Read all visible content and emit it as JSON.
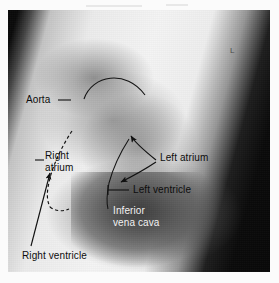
{
  "figure": {
    "modality": "radiograph",
    "view": "lateral",
    "film_marker": "L",
    "plate": {
      "x": 8,
      "y": 10,
      "width": 262,
      "height": 262,
      "background_color": "#0a0a0a"
    },
    "colors": {
      "page_background": "#ffffff",
      "film_dark": "#0a0a0a",
      "soft_tissue_bright": "#f4f4f4",
      "annotation_dark": "#0d0d0d",
      "annotation_light": "#f2f2f2"
    }
  },
  "annotations": [
    {
      "id": "aorta",
      "text": "Aorta",
      "text_color": "dark",
      "x": 26,
      "y": 100,
      "leader": "dash-right",
      "structure": "aortic arch"
    },
    {
      "id": "right-atrium",
      "text": "Right\natrium",
      "text_color": "dark",
      "x": 45,
      "y": 155,
      "leader": "dash-left",
      "structure": "right atrium"
    },
    {
      "id": "left-atrium",
      "text": "Left atrium",
      "text_color": "dark",
      "x": 160,
      "y": 157,
      "leader": "two-arrows",
      "structure": "left atrium"
    },
    {
      "id": "left-ventricle",
      "text": "Left ventricle",
      "text_color": "dark",
      "x": 133,
      "y": 184,
      "leader": "tick-left",
      "structure": "left ventricle"
    },
    {
      "id": "inferior-vena-cava",
      "text": "Inferior\nvena cava",
      "text_color": "light",
      "x": 113,
      "y": 205,
      "leader": "none",
      "structure": "inferior vena cava"
    },
    {
      "id": "right-ventricle",
      "text": "Right ventricle",
      "text_color": "dark",
      "x": 22,
      "y": 250,
      "leader": "long-arrow",
      "structure": "right ventricle"
    }
  ],
  "overlay_graphics": {
    "aortic_arch_arc": "solid thin arc over the aortic knuckle",
    "right_atrium_border": "dashed curve tracing the right atrial border",
    "left_atrium_arrows": "two converging arrows from the Left atrium label",
    "right_ventricle_arrow": "long diagonal arrow rising to the right ventricle"
  }
}
